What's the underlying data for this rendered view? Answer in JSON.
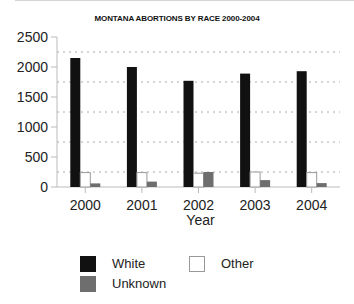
{
  "chart_data": {
    "type": "bar",
    "title": "MONTANA ABORTIONS BY RACE 2000-2004",
    "xlabel": "Year",
    "ylabel": "",
    "categories": [
      "2000",
      "2001",
      "2002",
      "2003",
      "2004"
    ],
    "series": [
      {
        "name": "White",
        "color": "#111111",
        "values": [
          2150,
          2000,
          1770,
          1890,
          1930
        ]
      },
      {
        "name": "Other",
        "color": "#ffffff",
        "values": [
          240,
          240,
          230,
          250,
          240
        ]
      },
      {
        "name": "Unknown",
        "color": "#6e6e6e",
        "values": [
          60,
          90,
          250,
          115,
          65
        ]
      }
    ],
    "ylim": [
      0,
      2500
    ],
    "yticks": [
      0,
      500,
      1000,
      1500,
      2000,
      2500
    ],
    "ytick_labels": [
      "0",
      "500",
      "1000",
      "1500",
      "2000",
      "2500"
    ],
    "gridlines": [
      250,
      750,
      1250,
      1750,
      2250
    ],
    "grid": true,
    "legend_position": "bottom"
  },
  "legend": {
    "items": [
      {
        "label": "White"
      },
      {
        "label": "Other"
      },
      {
        "label": "Unknown"
      }
    ]
  }
}
